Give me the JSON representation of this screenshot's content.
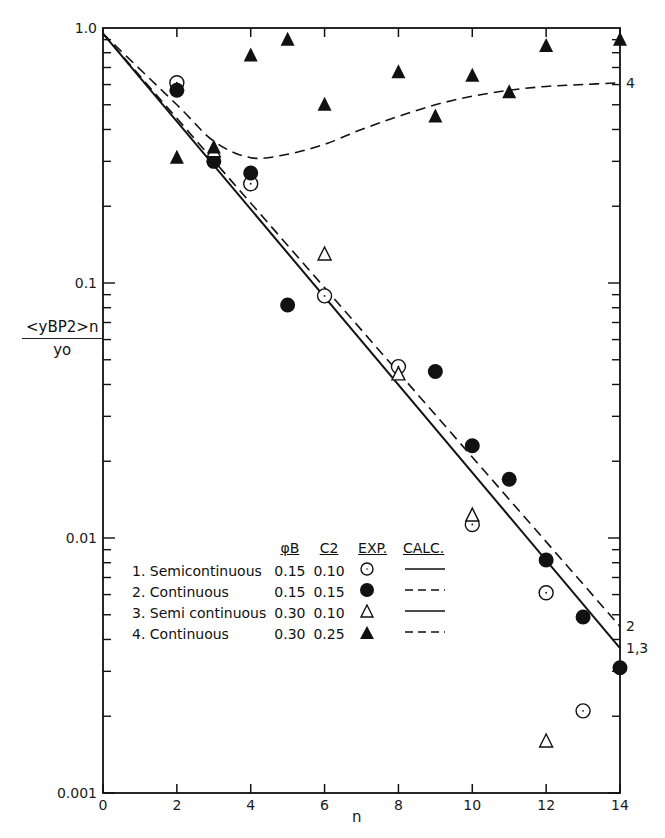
{
  "chart_data": {
    "type": "scatter",
    "title": "",
    "xlabel": "n",
    "ylabel": "<y_BP2>_n / y_0",
    "ylabel_numerator": "<yBP2>n",
    "ylabel_denominator": "yo",
    "xlim": [
      0,
      14
    ],
    "ylim": [
      0.001,
      1.0
    ],
    "yscale": "log",
    "grid": false,
    "x_ticks": [
      0,
      2,
      4,
      6,
      8,
      10,
      12,
      14
    ],
    "y_ticks": [
      {
        "value": 1.0,
        "label": "1.0"
      },
      {
        "value": 0.1,
        "label": "0.1"
      },
      {
        "value": 0.01,
        "label": "0.01"
      },
      {
        "value": 0.001,
        "label": "0.001"
      }
    ],
    "series": [
      {
        "id": 1,
        "name": "Semicontinuous",
        "phi_B": "0.15",
        "c2": "0.10",
        "marker": "open-circle",
        "calc_line": "solid",
        "x": [
          2,
          4,
          6,
          8,
          10,
          12,
          13
        ],
        "values": [
          0.61,
          0.245,
          0.089,
          0.047,
          0.0113,
          0.0061,
          0.0021
        ]
      },
      {
        "id": 2,
        "name": "Continuous",
        "phi_B": "0.15",
        "c2": "0.15",
        "marker": "filled-circle",
        "calc_line": "dashed",
        "x": [
          2,
          3,
          4,
          5,
          9,
          10,
          11,
          12,
          13,
          14
        ],
        "values": [
          0.57,
          0.3,
          0.27,
          0.082,
          0.045,
          0.023,
          0.017,
          0.0082,
          0.0049,
          0.0031
        ]
      },
      {
        "id": 3,
        "name": "Semicontinuous",
        "phi_B": "0.30",
        "c2": "0.10",
        "marker": "open-triangle",
        "calc_line": "solid",
        "x": [
          3,
          6,
          8,
          10,
          12
        ],
        "values": [
          0.33,
          0.13,
          0.044,
          0.0123,
          0.0016
        ]
      },
      {
        "id": 4,
        "name": "Continuous",
        "phi_B": "0.30",
        "c2": "0.25",
        "marker": "filled-triangle",
        "calc_line": "dashed",
        "x": [
          2,
          3,
          4,
          5,
          6,
          8,
          9,
          10,
          11,
          12,
          14
        ],
        "values": [
          0.31,
          0.34,
          0.78,
          0.9,
          0.5,
          0.67,
          0.45,
          0.65,
          0.56,
          0.85,
          0.9
        ]
      }
    ],
    "calc_curves": [
      {
        "label": "1,3",
        "style": "solid",
        "x": [
          0,
          14
        ],
        "values": [
          0.95,
          0.0037
        ]
      },
      {
        "label": "2",
        "style": "dashed",
        "x": [
          0,
          14
        ],
        "values": [
          0.95,
          0.0045
        ]
      },
      {
        "label": "4",
        "style": "dashed",
        "x": [
          0,
          2,
          3,
          4,
          5,
          6,
          7,
          8,
          9,
          10,
          11,
          12,
          13,
          14
        ],
        "values": [
          0.95,
          0.5,
          0.36,
          0.31,
          0.32,
          0.35,
          0.4,
          0.45,
          0.5,
          0.54,
          0.57,
          0.59,
          0.6,
          0.61
        ]
      }
    ],
    "curve_end_labels": [
      "4",
      "2",
      "1,3"
    ],
    "legend": {
      "position": "lower-left-inside",
      "headers": [
        "φB",
        "C2",
        "EXP.",
        "CALC."
      ],
      "rows": [
        {
          "label": "1. Semicontinuous",
          "phi_B": "0.15",
          "c2": "0.10",
          "exp": "open-circle",
          "calc": "solid"
        },
        {
          "label": "2. Continuous",
          "phi_B": "0.15",
          "c2": "0.15",
          "exp": "filled-circle",
          "calc": "dashed"
        },
        {
          "label": "3. Semi continuous",
          "phi_B": "0.30",
          "c2": "0.10",
          "exp": "open-triangle",
          "calc": "solid"
        },
        {
          "label": "4. Continuous",
          "phi_B": "0.30",
          "c2": "0.25",
          "exp": "filled-triangle",
          "calc": "dashed"
        }
      ]
    }
  }
}
